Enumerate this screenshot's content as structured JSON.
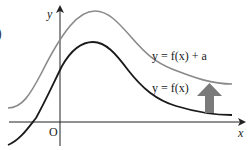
{
  "figure": {
    "type": "function-transformation-graph",
    "edge_fragment": ")",
    "axes": {
      "x_label": "x",
      "y_label": "y",
      "origin_label": "O"
    },
    "curves": [
      {
        "name": "translated",
        "label": "y = f(x) + a",
        "color": "#8a8a8a"
      },
      {
        "name": "original",
        "label": "y = f(x)",
        "color": "#1a1a1a"
      }
    ],
    "arrow": {
      "direction": "up",
      "color": "#7a7a7a",
      "meaning": "translation by a"
    },
    "colors": {
      "axis": "#222222",
      "background": "#ffffff"
    }
  }
}
